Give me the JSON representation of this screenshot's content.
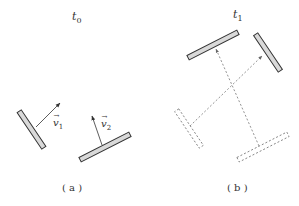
{
  "panel_a": {
    "time_label": "t",
    "time_sub": "0",
    "caption": "( a )",
    "v1_label": "v",
    "v1_sub": "1",
    "v2_label": "v",
    "v2_sub": "2"
  },
  "panel_b": {
    "time_label": "t",
    "time_sub": "1",
    "caption": "( b )"
  },
  "colors": {
    "bar_fill": "#d9d9d9",
    "bar_stroke": "#333333",
    "dashed": "#777777"
  }
}
